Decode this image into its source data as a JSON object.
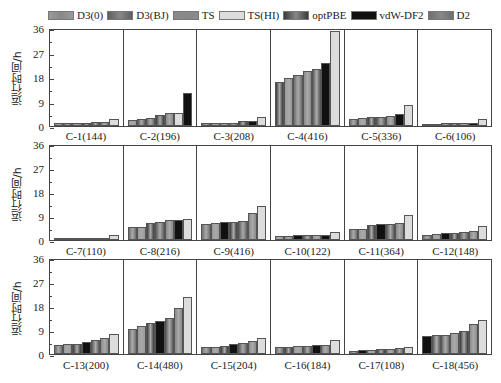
{
  "legend": [
    {
      "label": "D3(0)",
      "color": "#9a9a9a"
    },
    {
      "label": "D3(BJ)",
      "color": "#5e5e5e"
    },
    {
      "label": "TS",
      "color": "#8a8a8a"
    },
    {
      "label": "TS(HI)",
      "color": "#dcdcdc"
    },
    {
      "label": "optPBE",
      "color": "#3a3a3a"
    },
    {
      "label": "vdW-DF2",
      "color": "#111111"
    },
    {
      "label": "D2",
      "color": "#6e6e6e"
    }
  ],
  "y_axis_label": "运行时间/h",
  "y_ticks": [
    "36",
    "27",
    "18",
    "9",
    "0"
  ],
  "chart_data": {
    "type": "bar",
    "title": "",
    "xlabel": "",
    "ylabel": "运行时间/h",
    "ylim": [
      0,
      36
    ],
    "yticks": [
      0,
      9,
      18,
      27,
      36
    ],
    "grid": false,
    "legend_position": "top",
    "layout": "3 rows x 6 panels, each panel one system with 7 bars (values sorted ascending within panel)",
    "series_names": [
      "D3(0)",
      "D3(BJ)",
      "TS",
      "TS(HI)",
      "optPBE",
      "vdW-DF2",
      "D2"
    ],
    "panels": [
      {
        "label": "C-1(144)",
        "values": [
          1.0,
          1.1,
          1.2,
          1.3,
          1.4,
          1.5,
          2.8
        ]
      },
      {
        "label": "C-2(196)",
        "values": [
          2.3,
          2.8,
          2.9,
          4.3,
          4.7,
          5.0,
          12.5
        ]
      },
      {
        "label": "C-3(208)",
        "values": [
          1.1,
          1.2,
          1.2,
          1.3,
          1.9,
          2.0,
          3.5
        ]
      },
      {
        "label": "C-4(416)",
        "values": [
          16.5,
          18.0,
          19.0,
          20.5,
          21.5,
          23.5,
          35.5
        ]
      },
      {
        "label": "C-5(336)",
        "values": [
          2.8,
          3.0,
          3.3,
          3.5,
          3.8,
          4.4,
          7.8
        ]
      },
      {
        "label": "C-6(106)",
        "values": [
          0.9,
          0.9,
          1.0,
          1.0,
          1.1,
          1.2,
          2.7
        ]
      },
      {
        "label": "C-7(110)",
        "values": [
          0.6,
          0.6,
          0.7,
          0.7,
          0.8,
          0.9,
          2.0
        ]
      },
      {
        "label": "C-8(216)",
        "values": [
          5.0,
          5.1,
          6.5,
          7.0,
          7.5,
          7.8,
          7.9
        ]
      },
      {
        "label": "C-9(416)",
        "values": [
          6.3,
          6.6,
          6.8,
          7.0,
          7.2,
          10.5,
          13.2
        ]
      },
      {
        "label": "C-10(122)",
        "values": [
          1.4,
          1.4,
          1.8,
          1.9,
          2.0,
          2.1,
          3.2
        ]
      },
      {
        "label": "C-11(364)",
        "values": [
          4.2,
          4.3,
          5.6,
          6.0,
          6.3,
          6.5,
          9.5
        ]
      },
      {
        "label": "C-12(148)",
        "values": [
          2.1,
          2.4,
          2.6,
          2.8,
          2.9,
          3.3,
          5.5
        ]
      },
      {
        "label": "C-13(200)",
        "values": [
          3.5,
          3.8,
          3.9,
          4.6,
          5.2,
          6.3,
          7.6
        ]
      },
      {
        "label": "C-14(480)",
        "values": [
          9.5,
          10.8,
          11.8,
          12.5,
          13.7,
          17.8,
          22.0
        ]
      },
      {
        "label": "C-15(204)",
        "values": [
          2.7,
          2.8,
          3.0,
          3.8,
          4.4,
          4.8,
          6.0
        ]
      },
      {
        "label": "C-16(184)",
        "values": [
          2.5,
          2.5,
          2.9,
          2.9,
          3.3,
          3.4,
          5.3
        ]
      },
      {
        "label": "C-17(108)",
        "values": [
          1.2,
          1.6,
          1.7,
          1.8,
          1.9,
          2.2,
          2.6
        ]
      },
      {
        "label": "C-18(456)",
        "values": [
          7.0,
          7.3,
          7.4,
          8.1,
          8.8,
          11.5,
          13.2
        ]
      }
    ]
  },
  "panel_bar_colors": [
    [
      "#8c8c8c",
      "#5e5e5e",
      "#8a8a8a",
      "#3a3a3a",
      "#4a4a4a",
      "#7a7a7a",
      "#dcdcdc"
    ],
    [
      "#9a9a9a",
      "#5e5e5e",
      "#6e6e6e",
      "#3a3a3a",
      "#8a8a8a",
      "#dcdcdc",
      "#111111"
    ],
    [
      "#5e5e5e",
      "#9a9a9a",
      "#8a8a8a",
      "#6e6e6e",
      "#3a3a3a",
      "#111111",
      "#dcdcdc"
    ],
    [
      "#3a3a3a",
      "#9a9a9a",
      "#6e6e6e",
      "#8a8a8a",
      "#5e5e5e",
      "#111111",
      "#dcdcdc"
    ],
    [
      "#6e6e6e",
      "#9a9a9a",
      "#3a3a3a",
      "#5e5e5e",
      "#8a8a8a",
      "#111111",
      "#dcdcdc"
    ],
    [
      "#5e5e5e",
      "#9a9a9a",
      "#6e6e6e",
      "#3a3a3a",
      "#8a8a8a",
      "#111111",
      "#dcdcdc"
    ],
    [
      "#5e5e5e",
      "#9a9a9a",
      "#6e6e6e",
      "#3a3a3a",
      "#111111",
      "#8a8a8a",
      "#dcdcdc"
    ],
    [
      "#6e6e6e",
      "#9a9a9a",
      "#3a3a3a",
      "#5e5e5e",
      "#8a8a8a",
      "#111111",
      "#dcdcdc"
    ],
    [
      "#6e6e6e",
      "#9a9a9a",
      "#111111",
      "#3a3a3a",
      "#5e5e5e",
      "#8a8a8a",
      "#dcdcdc"
    ],
    [
      "#9a9a9a",
      "#8a8a8a",
      "#111111",
      "#5e5e5e",
      "#9a9a9a",
      "#111111",
      "#dcdcdc"
    ],
    [
      "#6e6e6e",
      "#9a9a9a",
      "#3a3a3a",
      "#111111",
      "#5e5e5e",
      "#8a8a8a",
      "#dcdcdc"
    ],
    [
      "#6e6e6e",
      "#9a9a9a",
      "#111111",
      "#3a3a3a",
      "#5e5e5e",
      "#8a8a8a",
      "#dcdcdc"
    ],
    [
      "#6e6e6e",
      "#9a9a9a",
      "#3a3a3a",
      "#111111",
      "#5e5e5e",
      "#8a8a8a",
      "#dcdcdc"
    ],
    [
      "#6e6e6e",
      "#9a9a9a",
      "#3a3a3a",
      "#111111",
      "#5e5e5e",
      "#8a8a8a",
      "#dcdcdc"
    ],
    [
      "#6e6e6e",
      "#9a9a9a",
      "#3a3a3a",
      "#111111",
      "#5e5e5e",
      "#8a8a8a",
      "#dcdcdc"
    ],
    [
      "#6e6e6e",
      "#3a3a3a",
      "#9a9a9a",
      "#5e5e5e",
      "#111111",
      "#8a8a8a",
      "#dcdcdc"
    ],
    [
      "#6e6e6e",
      "#111111",
      "#9a9a9a",
      "#3a3a3a",
      "#8a8a8a",
      "#5e5e5e",
      "#dcdcdc"
    ],
    [
      "#111111",
      "#5e5e5e",
      "#6e6e6e",
      "#9a9a9a",
      "#3a3a3a",
      "#8a8a8a",
      "#dcdcdc"
    ]
  ],
  "rows": [
    {
      "top": 29,
      "plot_height": 98,
      "label_top": 130
    },
    {
      "top": 145,
      "plot_height": 96,
      "label_top": 245
    },
    {
      "top": 259,
      "plot_height": 96,
      "label_top": 359
    }
  ]
}
